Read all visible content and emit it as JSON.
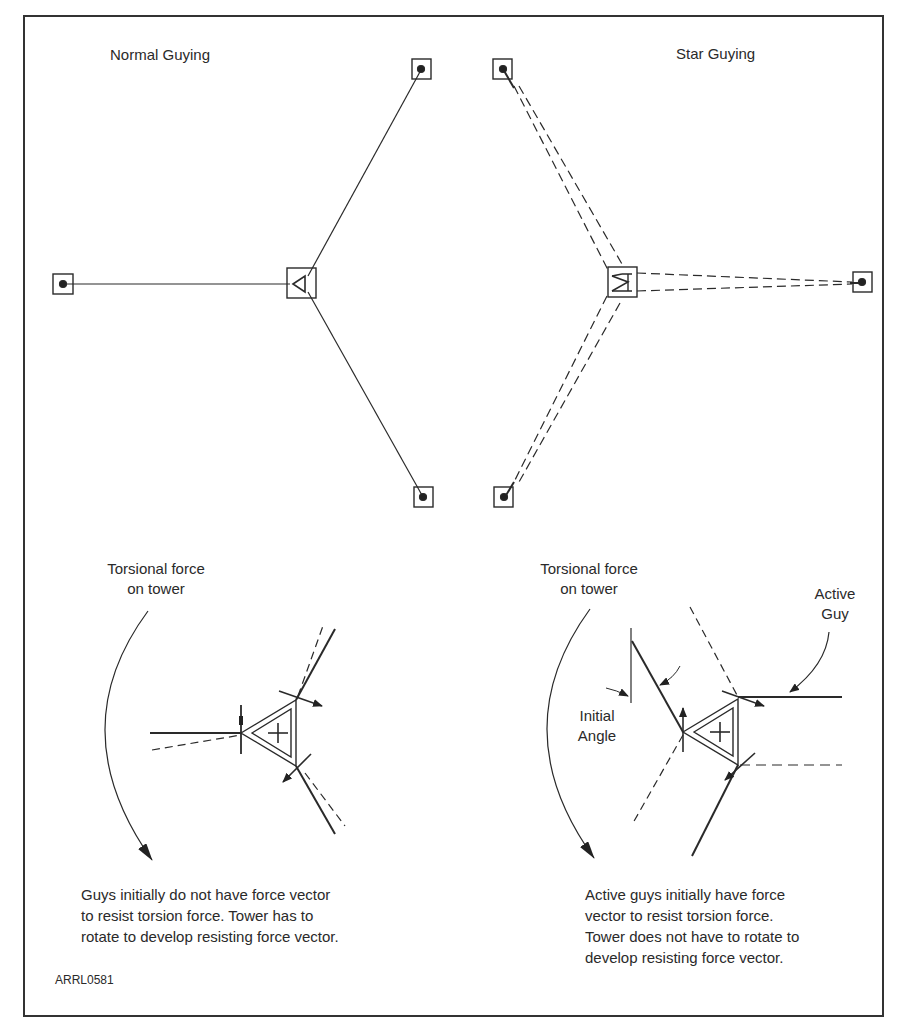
{
  "figure": {
    "id_code": "ARRL0581",
    "border_color": "#333333",
    "line_color": "#2a2a2a"
  },
  "normal_guying": {
    "title": "Normal Guying",
    "torsion_label_line1": "Torsional force",
    "torsion_label_line2": "on tower",
    "caption_lines": [
      "Guys initially do not have force vector",
      "to resist torsion force. Tower has to",
      "rotate to develop resisting force vector."
    ]
  },
  "star_guying": {
    "title": "Star Guying",
    "torsion_label_line1": "Torsional force",
    "torsion_label_line2": "on tower",
    "active_guy_line1": "Active",
    "active_guy_line2": "Guy",
    "initial_angle_line1": "Initial",
    "initial_angle_line2": "Angle",
    "caption_lines": [
      "Active guys initially have force",
      "vector to resist torsion force.",
      "Tower does not have to rotate to",
      "develop resisting force vector."
    ]
  }
}
